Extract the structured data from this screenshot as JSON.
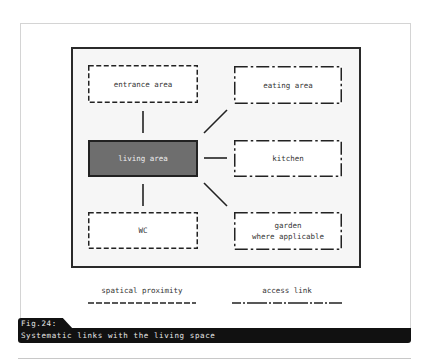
{
  "diagram": {
    "nodes": {
      "entrance": {
        "label": "entrance area",
        "link_style": "spatial proximity"
      },
      "eating": {
        "label": "eating area",
        "link_style": "access link"
      },
      "living": {
        "label": "living area",
        "role": "center"
      },
      "kitchen": {
        "label": "kitchen",
        "link_style": "access link"
      },
      "wc": {
        "label": "WC",
        "link_style": "spatial proximity"
      },
      "garden": {
        "label": "garden\nwhere applicable",
        "link_style": "access link"
      }
    },
    "edges": [
      {
        "from": "living",
        "to": "entrance"
      },
      {
        "from": "living",
        "to": "eating"
      },
      {
        "from": "living",
        "to": "kitchen"
      },
      {
        "from": "living",
        "to": "wc"
      },
      {
        "from": "living",
        "to": "garden"
      }
    ],
    "colors": {
      "center_fill": "#6e6e6e",
      "frame_border": "#2a2a2a",
      "caption_bg": "#111111"
    }
  },
  "legend": {
    "proximity_label": "spatical proximity",
    "access_label": "access link"
  },
  "caption": {
    "figure_number": "Fig.24:",
    "title": "Systematic links with the living space"
  }
}
